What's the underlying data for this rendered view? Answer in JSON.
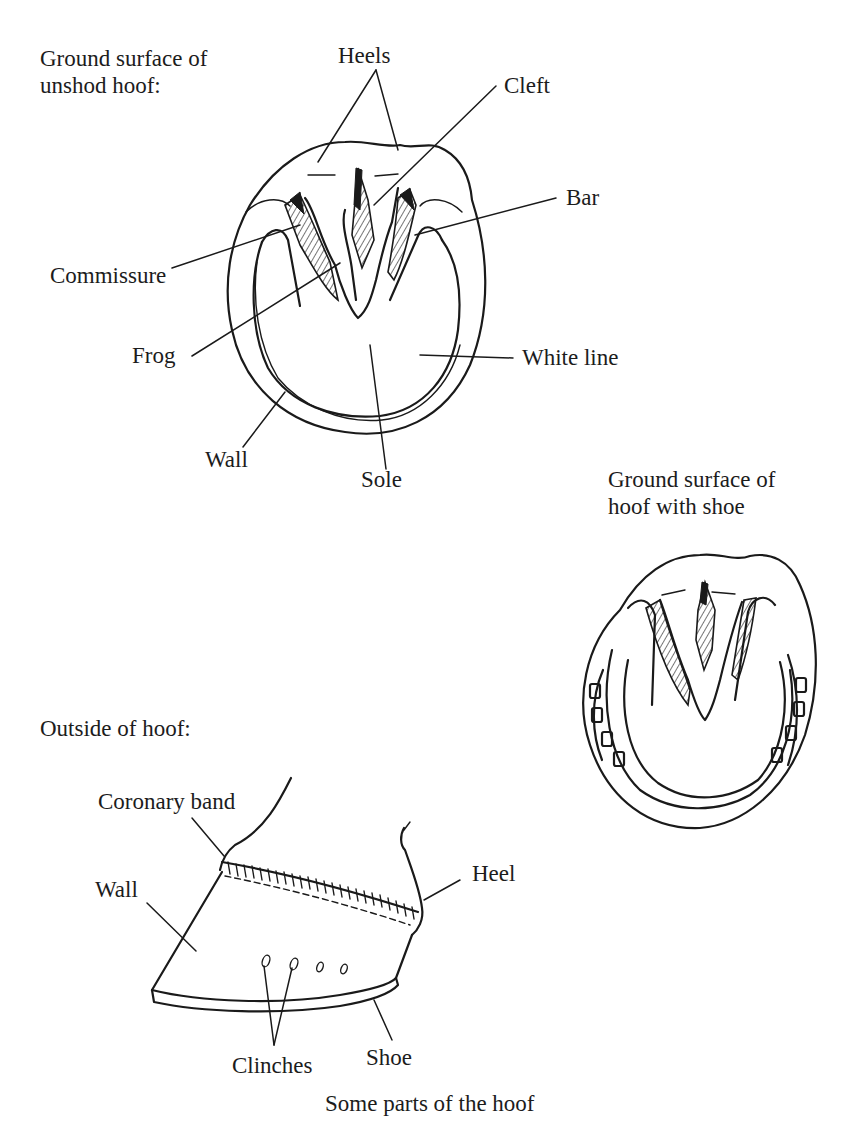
{
  "page": {
    "cutoff_header": "Chapter text cut off at top edge",
    "caption": "Some parts of the hoof"
  },
  "figures": {
    "unshod": {
      "heading": "Ground surface of\nunshod hoof:",
      "labels": {
        "heels": "Heels",
        "cleft": "Cleft",
        "bar": "Bar",
        "commissure": "Commissure",
        "frog": "Frog",
        "white_line": "White line",
        "wall": "Wall",
        "sole": "Sole"
      }
    },
    "shod": {
      "heading": "Ground surface of\nhoof with shoe"
    },
    "outside": {
      "heading": "Outside of hoof:",
      "labels": {
        "coronary_band": "Coronary band",
        "wall": "Wall",
        "heel": "Heel",
        "clinches": "Clinches",
        "shoe": "Shoe"
      }
    }
  },
  "colors": {
    "ink": "#1a1a1a",
    "paper": "#ffffff"
  }
}
